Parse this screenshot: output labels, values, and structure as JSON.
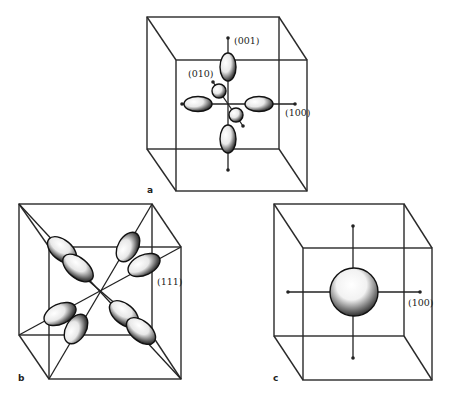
{
  "figure": {
    "panels": [
      {
        "id": "a",
        "panel_label": "a",
        "description": "p-orbital-like lobes along cubic axes",
        "labels": {
          "z": "(001)",
          "y": "(010)",
          "x": "(100)"
        }
      },
      {
        "id": "b",
        "panel_label": "b",
        "description": "lobes along body diagonals",
        "labels": {
          "diag": "(111)"
        }
      },
      {
        "id": "c",
        "panel_label": "c",
        "description": "spherical distribution at cube center",
        "labels": {
          "x": "(100)"
        }
      }
    ],
    "colors": {
      "line": "#2a2a2a",
      "shade": "#111111",
      "background": "#ffffff"
    }
  }
}
